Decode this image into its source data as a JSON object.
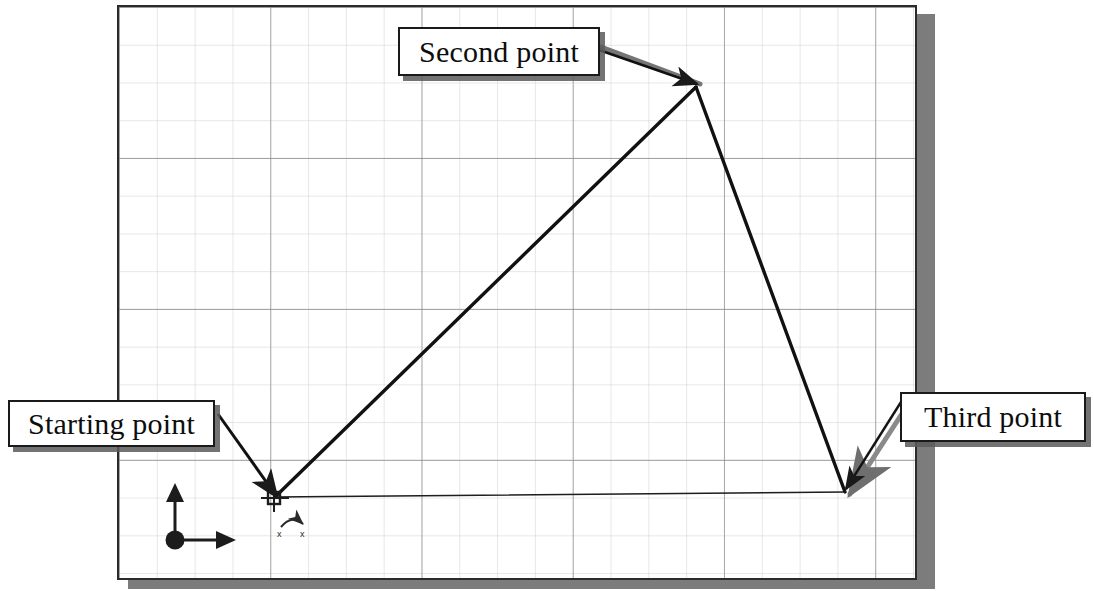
{
  "application": {
    "type": "cad-drawing-window",
    "description": "AutoCAD graphics area showing a three-point line sequence on a snap grid"
  },
  "drawing_area": {
    "background_color": "#ffffff",
    "border_color": "#2b2b2b",
    "shadow_color": "#7c7c7c",
    "grid": {
      "minor_spacing_px": 38,
      "minor_color": "#c9c9c9",
      "major_every": 4,
      "major_color": "#7a7a7a",
      "visible": true
    }
  },
  "callouts": [
    {
      "id": "second",
      "label": "Second point",
      "box": {
        "x": 398,
        "y": 27,
        "w": 202,
        "h": 49
      },
      "arrow": {
        "from_x": 600,
        "from_y": 52,
        "to_x": 694,
        "to_y": 86
      }
    },
    {
      "id": "starting",
      "label": "Starting point",
      "box": {
        "x": 8,
        "y": 400,
        "w": 207,
        "h": 47
      },
      "arrow": {
        "from_x": 215,
        "from_y": 413,
        "to_x": 272,
        "to_y": 494
      }
    },
    {
      "id": "third",
      "label": "Third point",
      "box": {
        "x": 900,
        "y": 392,
        "w": 186,
        "h": 50
      },
      "arrow": {
        "from_x": 900,
        "from_y": 404,
        "to_x": 848,
        "to_y": 489
      }
    }
  ],
  "geometry": {
    "line_color": "#111111",
    "vertices": [
      {
        "name": "starting-point",
        "x": 274,
        "y": 498
      },
      {
        "name": "second-point",
        "x": 696,
        "y": 87
      },
      {
        "name": "third-point",
        "x": 845,
        "y": 492
      }
    ],
    "segments": [
      {
        "name": "start-to-second",
        "from": 0,
        "to": 1,
        "width": 3.4
      },
      {
        "name": "second-to-third",
        "from": 1,
        "to": 2,
        "width": 3.4
      },
      {
        "name": "third-to-start",
        "from": 2,
        "to": 0,
        "width": 1.4
      }
    ]
  },
  "markers": {
    "ucs_icon": {
      "name": "ucs-origin-icon",
      "origin_x": 175,
      "origin_y": 540,
      "x_axis_length": 60,
      "y_axis_length": 53,
      "color": "#1c1c1c"
    },
    "crosshair": {
      "name": "crosshair-pickbox",
      "x": 274,
      "y": 497,
      "size": 26,
      "color": "#1c1c1c"
    },
    "rotation_symbol": {
      "name": "rotation-arc-icon",
      "x": 292,
      "y": 522,
      "color": "#2a2a2a"
    }
  }
}
